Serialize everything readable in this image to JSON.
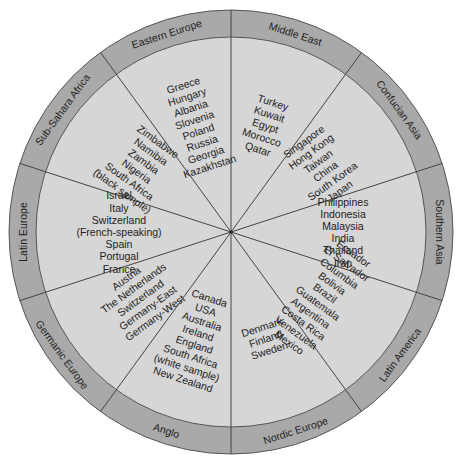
{
  "colors": {
    "ring": "#a9a9a9",
    "inner": "#d6d6d6",
    "lines": "#444444",
    "text": "#222222"
  },
  "clusters": [
    {
      "name": "Middle East",
      "countries": [
        "Turkey",
        "Kuwait",
        "Egypt",
        "Morocco",
        "Qatar"
      ]
    },
    {
      "name": "Confucian Asia",
      "countries": [
        "Singapore",
        "Hong Kong",
        "Taiwan",
        "China",
        "South Korea",
        "Japan"
      ]
    },
    {
      "name": "Southern Asia",
      "countries": [
        "Philippines",
        "Indonesia",
        "Malaysia",
        "India",
        "Thailand",
        "Iran"
      ]
    },
    {
      "name": "Latin America",
      "countries": [
        "Ecuador",
        "El Salvador",
        "Columbia",
        "Bolivia",
        "Brazil",
        "Guatemala",
        "Argentina",
        "Costa Rica",
        "Venezuela",
        "Mexico"
      ]
    },
    {
      "name": "Nordic Europe",
      "countries": [
        "Denmark",
        "Finland",
        "Sweden"
      ]
    },
    {
      "name": "Anglo",
      "countries": [
        "Canada",
        "USA",
        "Australia",
        "Ireland",
        "England",
        "South Africa",
        "(white sample)",
        "New Zealand"
      ]
    },
    {
      "name": "Germanic Europe",
      "countries": [
        "Austria",
        "The Netherlands",
        "Switzerland",
        "Germany-East",
        "Germany-West"
      ]
    },
    {
      "name": "Latin Europe",
      "countries": [
        "Israel",
        "Italy",
        "Switzerland",
        "(French-speaking)",
        "Spain",
        "Portugal",
        "France"
      ]
    },
    {
      "name": "Sub-Sahara Africa",
      "countries": [
        "Zimbabwe",
        "Namibia",
        "Zambia",
        "Nigeria",
        "South Africa",
        "(black sample)"
      ]
    },
    {
      "name": "Eastern Europe",
      "countries": [
        "Greece",
        "Hungary",
        "Albania",
        "Slovenia",
        "Poland",
        "Russia",
        "Georgia",
        "Kazakhstan"
      ]
    }
  ]
}
